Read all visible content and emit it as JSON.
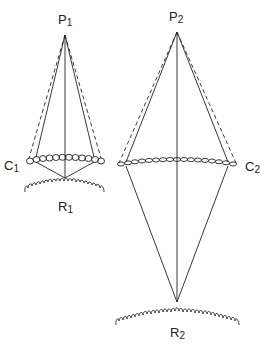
{
  "labels": {
    "p1": {
      "main": "P",
      "sub": "1"
    },
    "p2": {
      "main": "P",
      "sub": "2"
    },
    "c1": {
      "main": "C",
      "sub": "1"
    },
    "c2": {
      "main": "C",
      "sub": "2"
    },
    "r1": {
      "main": "R",
      "sub": "1"
    },
    "r2": {
      "main": "R",
      "sub": "2"
    }
  },
  "colors": {
    "line": "#222222",
    "background": "#ffffff"
  }
}
